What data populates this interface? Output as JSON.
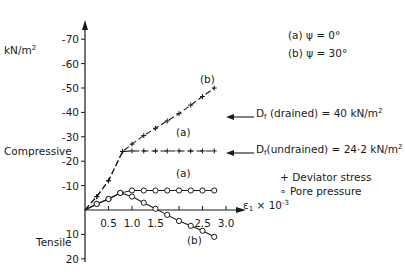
{
  "chart_data": {
    "type": "line",
    "title": "",
    "xlabel": "ε1 × 10^-3",
    "ylabel": "kN/m²",
    "xlim": [
      0,
      3.0
    ],
    "ylim": [
      20,
      -70
    ],
    "x_ticks": [
      0.5,
      1.0,
      1.5,
      2.0,
      2.5,
      3.0
    ],
    "x_tick_labels": [
      "0.5",
      "1.0",
      "1.5",
      "",
      "2.5",
      "3.0"
    ],
    "y_ticks": [
      -70,
      -60,
      -50,
      -40,
      -30,
      -20,
      -10,
      10,
      20
    ],
    "y_tick_labels": [
      "-70",
      "-60",
      "-50",
      "-40",
      "-30",
      "-20",
      "-10",
      "10",
      "20"
    ],
    "region_labels": {
      "compressive": "Compressive",
      "tensile": "Tensile"
    },
    "conditions": [
      {
        "label": "(a)",
        "text": "ψ = 0°"
      },
      {
        "label": "(b)",
        "text": "ψ = 30°"
      }
    ],
    "legend": [
      {
        "marker": "+",
        "text": "Deviator stress"
      },
      {
        "marker": "o",
        "text": "Pore pressure"
      }
    ],
    "annotations": [
      {
        "text": "Df (drained) = 40 kN/m²",
        "points_to": -40
      },
      {
        "text": "Df (undrained) = 24·2 kN/m²",
        "points_to": -24.2
      }
    ],
    "series": [
      {
        "name": "Deviator stress (a) ψ=0°",
        "marker": "+",
        "style": "dashed",
        "curve_label": "(a)",
        "x": [
          0,
          0.25,
          0.5,
          0.8,
          1.0,
          1.25,
          1.5,
          1.75,
          2.0,
          2.25,
          2.5,
          2.75
        ],
        "y": [
          0,
          -5.5,
          -12,
          -24,
          -24.2,
          -24.2,
          -24.2,
          -24.2,
          -24.2,
          -24.2,
          -24.2,
          -24.2
        ]
      },
      {
        "name": "Deviator stress (b) ψ=30°",
        "marker": "+",
        "style": "dashed",
        "curve_label": "(b)",
        "x": [
          0,
          0.25,
          0.5,
          0.8,
          1.0,
          1.25,
          1.5,
          1.75,
          2.0,
          2.25,
          2.5,
          2.75
        ],
        "y": [
          0,
          -5.5,
          -12,
          -24,
          -27,
          -30.5,
          -33.5,
          -36.5,
          -39.5,
          -43,
          -46.5,
          -50
        ]
      },
      {
        "name": "Pore pressure (a) ψ=0°",
        "marker": "o",
        "style": "solid",
        "curve_label": "(a)",
        "x": [
          0,
          0.25,
          0.5,
          0.75,
          1.0,
          1.25,
          1.5,
          1.75,
          2.0,
          2.25,
          2.5,
          2.75
        ],
        "y": [
          0,
          -2.5,
          -4.5,
          -7,
          -8,
          -8,
          -8,
          -8,
          -8,
          -8,
          -8,
          -8
        ]
      },
      {
        "name": "Pore pressure (b) ψ=30°",
        "marker": "o",
        "style": "solid",
        "curve_label": "(b)",
        "x": [
          0,
          0.25,
          0.5,
          0.75,
          1.0,
          1.25,
          1.5,
          1.75,
          2.0,
          2.25,
          2.5,
          2.75
        ],
        "y": [
          0,
          -2.5,
          -4.5,
          -7,
          -5.5,
          -3,
          -0.5,
          2,
          4.5,
          6.5,
          8.5,
          11
        ]
      }
    ]
  },
  "labels": {
    "units": "kN/m",
    "units_sup": "2",
    "compressive": "Compressive",
    "tensile": "Tensile",
    "cond_a": "(a)  ψ = 0°",
    "cond_b": "(b)  ψ = 30°",
    "ann_drained_pre": "D",
    "ann_drained_sub": "f",
    "ann_drained_post": " (drained) = 40 kN/m",
    "ann_undrained_pre": "D",
    "ann_undrained_sub": "f",
    "ann_undrained_post": "(undrained) = 24·2 kN/m",
    "sq": "2",
    "legend_dev": "+ Deviator stress",
    "legend_pore": "∘ Pore pressure",
    "xlabel_main": "ε",
    "xlabel_sub": "1",
    "xlabel_rest": " × 10",
    "xlabel_exp": "-3",
    "curve_b_top": "(b)",
    "curve_a_dev": "(a)",
    "curve_a_pore": "(a)",
    "curve_b_pore": "(b)"
  }
}
